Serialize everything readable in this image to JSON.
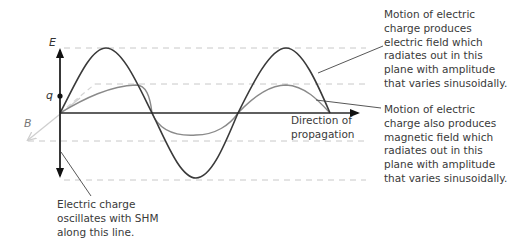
{
  "diagram": {
    "axis_labels": {
      "electric_field": "E",
      "magnetic_field": "B",
      "charge": "q"
    },
    "propagation_label": [
      "Direction of",
      "propagation"
    ],
    "annotations": {
      "electric_field": [
        "Motion of electric",
        "charge produces",
        "electric field which",
        "radiates out in this",
        "plane with amplitude",
        "that varies sinusoidally."
      ],
      "magnetic_field": [
        "Motion of electric",
        "charge also produces",
        "magnetic field which",
        "radiates out in this",
        "plane with amplitude",
        "that varies sinusoidally."
      ],
      "charge": [
        "Electric charge",
        "oscillates with SHM",
        "along this line."
      ]
    },
    "colors": {
      "e_wave": "#3a3a3a",
      "b_wave": "#8a8a8a",
      "axis": "#2a2a2a",
      "dashed": "#c8c8c8",
      "b_axis": "#cfcfcf"
    }
  }
}
